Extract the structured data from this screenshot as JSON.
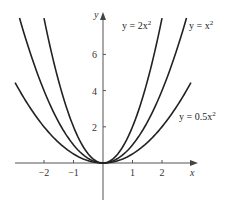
{
  "chart_data": {
    "type": "line",
    "title": "",
    "xlabel": "x",
    "ylabel": "y",
    "xlim": [
      -3,
      3.1
    ],
    "ylim": [
      -2,
      8.2
    ],
    "grid": false,
    "x_ticks": [
      -2,
      -1,
      1,
      2
    ],
    "x_tick_labels": [
      "−2",
      "−1",
      "1",
      "2"
    ],
    "y_ticks": [
      2,
      4,
      6
    ],
    "y_tick_labels": [
      "2",
      "4",
      "6"
    ],
    "series": [
      {
        "name": "y = 2x²",
        "label_main": "y = 2x",
        "coef": 2,
        "x_range": [
          -2.0,
          2.0
        ],
        "values_at": {
          "-2": 8,
          "-1": 2,
          "0": 0,
          "1": 2,
          "2": 8
        }
      },
      {
        "name": "y = x²",
        "label_main": "y = x",
        "coef": 1,
        "x_range": [
          -2.83,
          2.83
        ],
        "values_at": {
          "-2": 4,
          "-1": 1,
          "0": 0,
          "1": 1,
          "2": 4
        }
      },
      {
        "name": "y = 0.5x²",
        "label_main": "y = 0.5x",
        "coef": 0.5,
        "x_range": [
          -2.98,
          2.98
        ],
        "values_at": {
          "-2": 2,
          "-1": 0.5,
          "0": 0,
          "1": 0.5,
          "2": 2
        }
      }
    ],
    "label_superscript": "2"
  }
}
